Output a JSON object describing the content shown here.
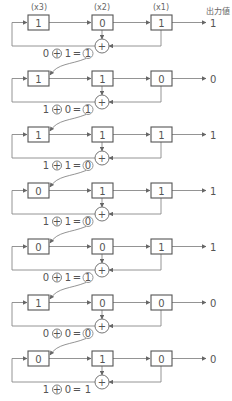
{
  "header": {
    "register_labels": [
      "(x3)",
      "(x2)",
      "(x1)"
    ],
    "output_label": "出力値"
  },
  "stages": [
    {
      "x3": "1",
      "x2": "0",
      "x1": "1",
      "output": "1",
      "formula": {
        "a": "0",
        "b": "1",
        "result": "1",
        "result_circled": true
      }
    },
    {
      "x3": "1",
      "x2": "1",
      "x1": "0",
      "output": "0",
      "formula": {
        "a": "1",
        "b": "0",
        "result": "1",
        "result_circled": true
      }
    },
    {
      "x3": "1",
      "x2": "1",
      "x1": "1",
      "output": "1",
      "formula": {
        "a": "1",
        "b": "1",
        "result": "0",
        "result_circled": true
      }
    },
    {
      "x3": "0",
      "x2": "1",
      "x1": "1",
      "output": "1",
      "formula": {
        "a": "1",
        "b": "1",
        "result": "0",
        "result_circled": true
      }
    },
    {
      "x3": "0",
      "x2": "0",
      "x1": "1",
      "output": "1",
      "formula": {
        "a": "0",
        "b": "1",
        "result": "1",
        "result_circled": true
      }
    },
    {
      "x3": "1",
      "x2": "0",
      "x1": "0",
      "output": "0",
      "formula": {
        "a": "0",
        "b": "0",
        "result": "0",
        "result_circled": true
      }
    },
    {
      "x3": "0",
      "x2": "1",
      "x1": "0",
      "output": "0",
      "formula": {
        "a": "1",
        "b": "0",
        "result": "1",
        "result_circled": false
      }
    }
  ],
  "symbols": {
    "xor": "+",
    "equals": "="
  }
}
